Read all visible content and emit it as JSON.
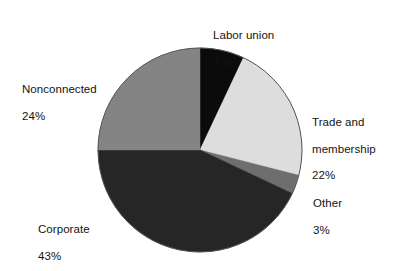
{
  "chart_data": {
    "type": "pie",
    "title": "",
    "subtitle": "",
    "xlabel": "",
    "ylabel": "",
    "legend_position": "none",
    "grid": false,
    "units": "percent",
    "start_angle_deg": 0,
    "direction": "clockwise",
    "categories": [
      "Labor union",
      "Trade and membership",
      "Other",
      "Corporate",
      "Nonconnected"
    ],
    "values": [
      7,
      22,
      3,
      43,
      24
    ],
    "slices": [
      {
        "name": "Labor union",
        "label_lines": [
          "Labor union",
          "7 %"
        ],
        "value": 7,
        "value_text": "7 %",
        "color": "#0b0b0b",
        "start_deg": 0,
        "end_deg": 25.2
      },
      {
        "name": "Trade and membership",
        "label_lines": [
          "Trade and",
          "membership",
          "22%"
        ],
        "value": 22,
        "value_text": "22%",
        "color": "#dddddd",
        "start_deg": 25.2,
        "end_deg": 104.4
      },
      {
        "name": "Other",
        "label_lines": [
          "Other",
          "3%"
        ],
        "value": 3,
        "value_text": "3%",
        "color": "#6e6e6e",
        "start_deg": 104.4,
        "end_deg": 115.2
      },
      {
        "name": "Corporate",
        "label_lines": [
          "Corporate",
          "43%"
        ],
        "value": 43,
        "value_text": "43%",
        "color": "#262626",
        "start_deg": 115.2,
        "end_deg": 270
      },
      {
        "name": "Nonconnected",
        "label_lines": [
          "Nonconnected",
          "24%"
        ],
        "value": 24,
        "value_text": "24%",
        "color": "#848484",
        "start_deg": 270,
        "end_deg": 360
      }
    ]
  },
  "labels": {
    "labor_union": {
      "name": "Labor union",
      "value": "7 %"
    },
    "nonconnected": {
      "name": "Nonconnected",
      "value": "24%"
    },
    "trade_line1": "Trade and",
    "trade_line2": "membership",
    "trade_value": "22%",
    "other": {
      "name": "Other",
      "value": "3%"
    },
    "corporate": {
      "name": "Corporate",
      "value": "43%"
    }
  },
  "geometry": {
    "center_x": 200,
    "center_y": 150,
    "radius": 102
  },
  "colors": {
    "background": "#ffffff",
    "text": "#131313",
    "slice_labor_union": "#0b0b0b",
    "slice_trade": "#dddddd",
    "slice_other": "#6e6e6e",
    "slice_corporate": "#262626",
    "slice_nonconnected": "#848484",
    "outline": "#4a4a4a"
  }
}
